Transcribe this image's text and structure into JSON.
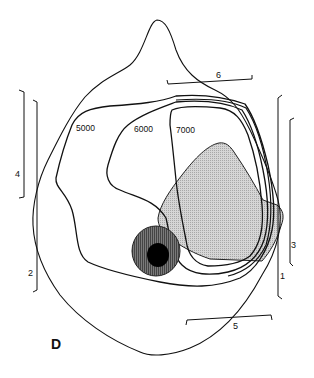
{
  "figure": {
    "panel_label": "D",
    "contour_labels": [
      "5000",
      "6000",
      "7000"
    ],
    "region_labels": {
      "r1": "1",
      "r2": "2",
      "r3": "3",
      "r4": "4",
      "r5": "5",
      "r6": "6"
    },
    "colors": {
      "outline": "#111111",
      "shaded_region": "#c9c9c9",
      "ring": "#6a6a6a",
      "core": "#000000",
      "background": "#ffffff"
    }
  }
}
